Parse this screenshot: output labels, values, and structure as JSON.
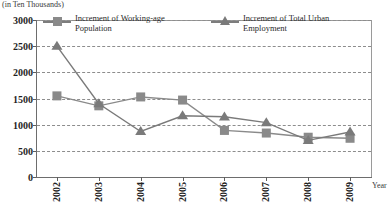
{
  "chart_data": {
    "type": "line",
    "title": "",
    "unit_note": "(in Ten Thousands)",
    "xlabel": "Year",
    "ylabel": "",
    "categories": [
      "2002",
      "2003",
      "2004",
      "2005",
      "2006",
      "2007",
      "2008",
      "2009"
    ],
    "ylim": [
      0,
      3000
    ],
    "yticks": [
      0,
      500,
      1000,
      1500,
      2000,
      2500,
      3000
    ],
    "ytick_labels": [
      "0",
      "500",
      "1000",
      "1500",
      "2000",
      "2500",
      "3000"
    ],
    "grid": true,
    "legend_position": "top-inside",
    "series": [
      {
        "name": "Increment of Working-age Population",
        "marker": "square",
        "color": "#8a8a8a",
        "values": [
          1550,
          1360,
          1530,
          1470,
          890,
          840,
          760,
          740
        ]
      },
      {
        "name": "Increment of Total Urban Employment",
        "marker": "triangle",
        "color": "#7a7a7a",
        "values": [
          2500,
          1400,
          870,
          1170,
          1150,
          1040,
          700,
          860
        ]
      }
    ]
  },
  "legend": {
    "entries": [
      {
        "label": "Increment of Working-age\nPopulation",
        "marker": "square-marker-icon"
      },
      {
        "label": "Increment of Total Urban\nEmployment",
        "marker": "triangle-marker-icon"
      }
    ]
  },
  "axes": {
    "y_tick_labels": [
      "3000",
      "2500",
      "2000",
      "1500",
      "1000",
      "500",
      "0"
    ],
    "x_tick_labels": [
      "2002",
      "2003",
      "2004",
      "2005",
      "2006",
      "2007",
      "2008",
      "2009"
    ],
    "x_axis_title": "Year",
    "unit_note": "(in Ten Thousands)"
  },
  "colors": {
    "series_1": "#8a8a8a",
    "series_2": "#7a7a7a",
    "grid": "#8d8d8d",
    "axis": "#6d6d6d",
    "text": "#1f1f1f",
    "background": "#ffffff"
  }
}
